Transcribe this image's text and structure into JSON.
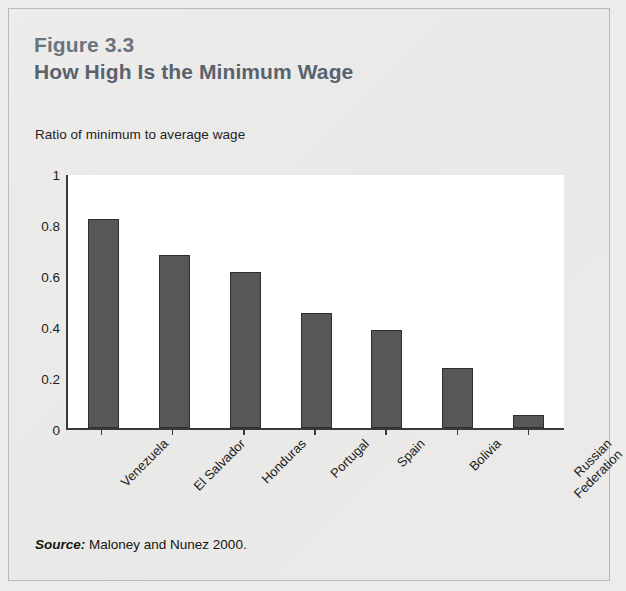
{
  "figure": {
    "number": "Figure 3.3",
    "title": "How High Is the Minimum Wage",
    "source_label": "Source:",
    "source_text": "Maloney and Nunez 2000."
  },
  "colors": {
    "page_background": "#e9e9e7",
    "plot_background": "#ffffff",
    "bar_fill": "#57575a",
    "bar_border": "#2e2e30",
    "axis": "#3a3a3a",
    "title": "#58636e",
    "figure_number": "#6a7480",
    "card_border": "#b9b9b7",
    "text": "#1d1d1b"
  },
  "chart_data": {
    "type": "bar",
    "title": "How High Is the Minimum Wage",
    "subtitle": "Figure 3.3",
    "ylabel": "Ratio of minimum to average wage",
    "xlabel": "",
    "categories": [
      "Venezuela",
      "El Salvador",
      "Honduras",
      "Portugal",
      "Spain",
      "Bolivia",
      "Russian Federation"
    ],
    "values": [
      0.82,
      0.68,
      0.61,
      0.45,
      0.385,
      0.235,
      0.05
    ],
    "ylim": [
      0,
      1
    ],
    "yticks": [
      0,
      0.2,
      0.4,
      0.6,
      0.8,
      1
    ],
    "ytick_labels": [
      "0",
      "0.2",
      "0.4",
      "0.6",
      "0.8",
      "1"
    ],
    "grid": false,
    "legend": false,
    "xtick_rotation": -45,
    "source": "Source: Maloney and Nunez 2000."
  }
}
